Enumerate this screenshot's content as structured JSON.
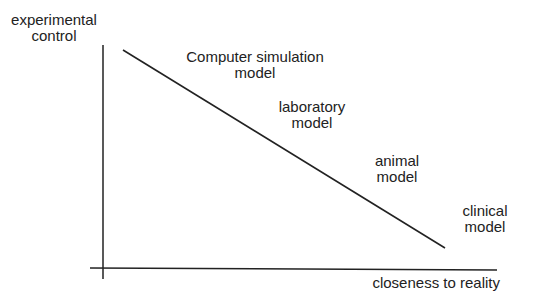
{
  "diagram": {
    "y_axis_label": [
      "experimental",
      "control"
    ],
    "x_axis_label": "closeness to reality",
    "models": [
      {
        "name": "computer-simulation",
        "lines": [
          "Computer simulation",
          "model"
        ]
      },
      {
        "name": "laboratory",
        "lines": [
          "laboratory",
          "model"
        ]
      },
      {
        "name": "animal",
        "lines": [
          "animal",
          "model"
        ]
      },
      {
        "name": "clinical",
        "lines": [
          "clinical",
          "model"
        ]
      }
    ],
    "relationship": "inverse: as closeness to reality increases, experimental control decreases"
  },
  "colors": {
    "ink": "#1a1a1a",
    "background": "#ffffff"
  }
}
